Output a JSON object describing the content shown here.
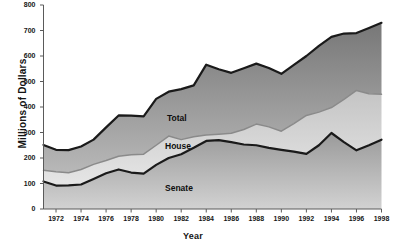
{
  "chart_data": {
    "type": "area",
    "title": "",
    "xlabel": "Year",
    "ylabel": "Millions of Dollars",
    "xlim": [
      1971,
      1998
    ],
    "ylim": [
      0,
      800
    ],
    "grid": false,
    "legend_position": "inline-labels",
    "x": [
      1971,
      1972,
      1973,
      1974,
      1975,
      1976,
      1977,
      1978,
      1979,
      1980,
      1981,
      1982,
      1983,
      1984,
      1985,
      1986,
      1987,
      1988,
      1989,
      1990,
      1991,
      1992,
      1993,
      1994,
      1995,
      1996,
      1997,
      1998
    ],
    "x_tick_labels": [
      "1972",
      "1974",
      "1976",
      "1978",
      "1980",
      "1982",
      "1984",
      "1986",
      "1988",
      "1990",
      "1992",
      "1994",
      "1996",
      "1998"
    ],
    "x_ticks": [
      1972,
      1974,
      1976,
      1978,
      1980,
      1982,
      1984,
      1986,
      1988,
      1990,
      1992,
      1994,
      1996,
      1998
    ],
    "y_tick_labels": [
      "0",
      "100",
      "200",
      "300",
      "400",
      "500",
      "600",
      "700",
      "800"
    ],
    "y_ticks": [
      0,
      100,
      200,
      300,
      400,
      500,
      600,
      700,
      800
    ],
    "series": [
      {
        "name": "Senate",
        "label": "Senate",
        "values": [
          108,
          92,
          93,
          96,
          118,
          140,
          155,
          143,
          139,
          173,
          200,
          215,
          240,
          267,
          270,
          262,
          253,
          250,
          240,
          232,
          225,
          216,
          250,
          298,
          262,
          230,
          250,
          272
        ]
      },
      {
        "name": "House",
        "label": "House",
        "values": [
          152,
          146,
          142,
          155,
          175,
          190,
          207,
          213,
          215,
          250,
          286,
          272,
          283,
          290,
          293,
          297,
          312,
          333,
          322,
          305,
          335,
          367,
          380,
          398,
          430,
          465,
          452,
          450
        ]
      },
      {
        "name": "Total",
        "label": "Total",
        "values": [
          251,
          232,
          231,
          245,
          272,
          320,
          367,
          366,
          363,
          432,
          460,
          470,
          485,
          566,
          548,
          534,
          552,
          570,
          553,
          530,
          565,
          600,
          640,
          675,
          688,
          690,
          710,
          730
        ]
      }
    ],
    "series_colors": {
      "senate_fill_top": "#9b9b9b",
      "senate_fill_bottom": "#cccccc",
      "house_fill_top": "#c8c8c8",
      "house_fill_bottom": "#e3e3e3",
      "total_fill_top": "#7d7d7d",
      "total_fill_bottom": "#b4b4b4",
      "senate_line": "#1a1a1a",
      "house_line": "#7a7a7a",
      "total_line": "#1a1a1a"
    },
    "axis_color": "#5a5a5a",
    "background": "#ffffff"
  }
}
